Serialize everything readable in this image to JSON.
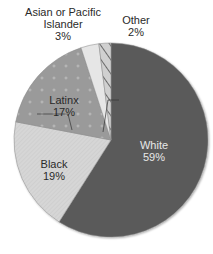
{
  "chart_data": {
    "type": "pie",
    "title": "",
    "start_angle_deg": 0,
    "direction": "clockwise",
    "slices": [
      {
        "label": "White",
        "value": 59,
        "display": "59%",
        "color": "#5a5a5a",
        "pattern": "solid"
      },
      {
        "label": "Black",
        "value": 19,
        "display": "19%",
        "color": "#d4d4d4",
        "pattern": "diagonal-fine"
      },
      {
        "label": "Latinx",
        "value": 17,
        "display": "17%",
        "color": "#9a9a9a",
        "pattern": "plus-dots"
      },
      {
        "label": "Asian or Pacific Islander",
        "value": 3,
        "display": "3%",
        "color": "#e6e6e6",
        "pattern": "solid"
      },
      {
        "label": "Other",
        "value": 2,
        "display": "2%",
        "color": "#cfcfcf",
        "pattern": "hatched"
      }
    ],
    "labels": {
      "white": {
        "line1": "White",
        "line2": "59%"
      },
      "black": {
        "line1": "Black",
        "line2": "19%"
      },
      "latinx": {
        "line1": "Latinx",
        "line2": "17%"
      },
      "asian": {
        "line1": "Asian or Pacific",
        "line2": "Islander",
        "line3": "3%"
      },
      "other": {
        "line1": "Other",
        "line2": "2%"
      }
    },
    "legend": "none"
  }
}
